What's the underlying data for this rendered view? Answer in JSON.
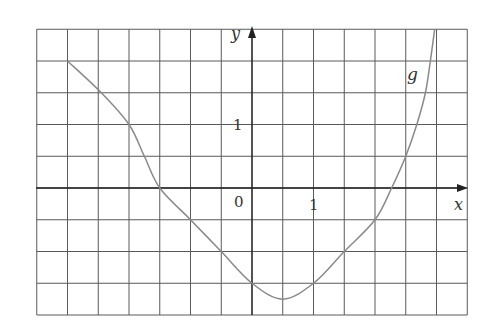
{
  "chart_data": {
    "type": "line",
    "title": "",
    "xlabel": "x",
    "ylabel": "y",
    "series": [
      {
        "name": "g",
        "x": [
          -3,
          -2.45,
          -2,
          -1.75,
          -1.5,
          -1,
          -0.5,
          0,
          0.5,
          1,
          1.5,
          2,
          2.27,
          2.5,
          2.68,
          2.82,
          2.9,
          2.97
        ],
        "y": [
          2,
          1.5,
          1,
          0.5,
          0,
          -0.5,
          -1,
          -1.5,
          -1.75,
          -1.5,
          -1,
          -0.5,
          0,
          0.5,
          1,
          1.5,
          2,
          2.5
        ]
      }
    ],
    "xlim": [
      -3.5,
      3.5
    ],
    "ylim": [
      -2,
      2.5
    ],
    "grid": true,
    "grid_step": 0.5,
    "tick_labels": {
      "x": [
        "0",
        "1"
      ],
      "y": [
        "1"
      ]
    },
    "annotations": [
      {
        "text": "g",
        "x": 2.6,
        "y": 1.75
      }
    ]
  },
  "labels": {
    "y_axis": "y",
    "x_axis": "x",
    "origin": "0",
    "x_one": "1",
    "y_one": "1",
    "curve": "g"
  },
  "colors": {
    "grid": "#5a5a5a",
    "curve": "#8a8a8a",
    "axis": "#222222"
  }
}
